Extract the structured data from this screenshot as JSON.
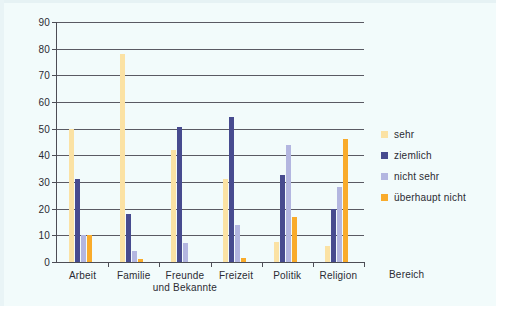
{
  "chart_data": {
    "type": "bar",
    "title": "",
    "xlabel": "Bereich",
    "ylabel": "",
    "ylim": [
      0,
      90
    ],
    "yticks": [
      0,
      10,
      20,
      30,
      40,
      50,
      60,
      70,
      80,
      90
    ],
    "grid": true,
    "legend_position": "right",
    "categories": [
      "Arbeit",
      "Familie",
      "Freunde und Bekannte",
      "Freizeit",
      "Politik",
      "Religion"
    ],
    "category_lines": [
      [
        "Arbeit",
        ""
      ],
      [
        "Familie",
        ""
      ],
      [
        "Freunde",
        "und Bekannte"
      ],
      [
        "Freizeit",
        ""
      ],
      [
        "Politik",
        ""
      ],
      [
        "Religion",
        ""
      ]
    ],
    "series": [
      {
        "name": "sehr",
        "color": "#fbe2a4",
        "values": [
          50,
          78,
          42,
          31,
          7.5,
          6
        ]
      },
      {
        "name": "ziemlich",
        "color": "#474b8f",
        "values": [
          31,
          18,
          50.5,
          54.5,
          32.5,
          20
        ]
      },
      {
        "name": "nicht sehr",
        "color": "#b3b6e0",
        "values": [
          10,
          4,
          7,
          14,
          44,
          28
        ]
      },
      {
        "name": "überhaupt nicht",
        "color": "#f9ab2b",
        "values": [
          10,
          1,
          0,
          1.5,
          17,
          46
        ]
      }
    ]
  },
  "legend": {
    "items": [
      {
        "label": "sehr",
        "color": "#fbe2a4"
      },
      {
        "label": "ziemlich",
        "color": "#474b8f"
      },
      {
        "label": "nicht sehr",
        "color": "#b3b6e0"
      },
      {
        "label": "überhaupt nicht",
        "color": "#f9ab2b"
      }
    ]
  },
  "axis": {
    "x_title": "Bereich"
  },
  "colors": {
    "axis_line": "#4d4d55",
    "gridline": "#5a5a63",
    "text": "#2b2b33",
    "page_background": "#f2fbfb"
  }
}
